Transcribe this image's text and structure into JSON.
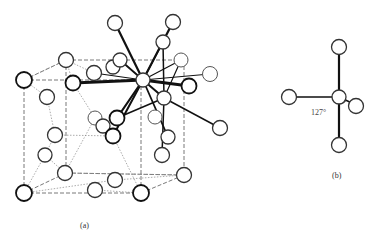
{
  "figure": {
    "panel_a": {
      "label": "(a)"
    },
    "panel_b": {
      "label": "(b)",
      "angle_label": "127°"
    }
  }
}
